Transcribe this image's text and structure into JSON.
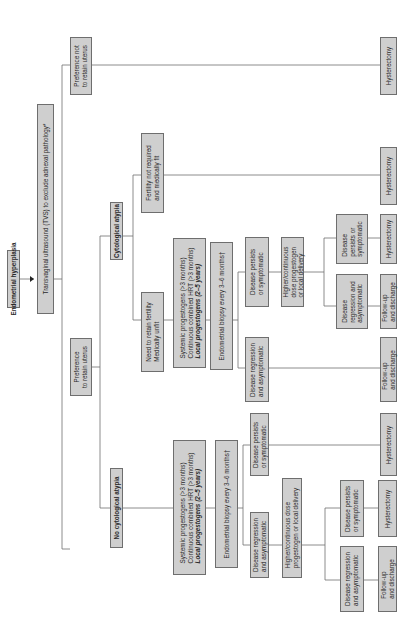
{
  "title": "Endometrial hyperplasia",
  "nodes": {
    "root": "Endometrial hyperplasia",
    "tvs": "Transvaginal ultrasound (TVS) to exclude adnexal pathology*",
    "retain": [
      "Preference",
      "to retain uterus"
    ],
    "not_retain": [
      "Preference not",
      "to retain uterus"
    ],
    "not_retain_outcome": "Hysterectomy",
    "atypia": "Cytological atypia",
    "no_atypia": "No cytological atypia",
    "atypia_fertility_not_required": [
      "Fertility not required",
      "and medically fit"
    ],
    "atypia_fertility_not_required_outcome": "Hysterectomy",
    "atypia_need_fertility": [
      "Need to retain fertility",
      "Medically unfit"
    ],
    "atypia_treatment": [
      "Systemic progestogens (>3 months)",
      "Continuous combined HRT (>3 months)",
      "Local progestogens (2–5 years)"
    ],
    "atypia_biopsy": "Endometrial biopsy every 3–6 months†",
    "atypia_persists": [
      "Disease persists",
      "or symptomatic"
    ],
    "atypia_regression": [
      "Disease regression",
      "and asymptomatic"
    ],
    "atypia_regression_outcome": [
      "Follow-up",
      "and discharge"
    ],
    "atypia_higher_dose": [
      "Higher/continuous",
      "dose progestogen",
      "or local delivery"
    ],
    "atypia_hd_persists": [
      "Disease",
      "persists or",
      "symptomatic"
    ],
    "atypia_hd_persists_outcome": "Hysterectomy",
    "atypia_hd_regression": [
      "Disease",
      "regression and",
      "asymptomatic"
    ],
    "atypia_hd_regression_outcome": [
      "Follow-up",
      "and discharge"
    ],
    "no_atypia_treatment": [
      "Systemic progestogens (>3 months)",
      "Continuous combined HRT (>3 months)",
      "Local progestogens (2–5 years)"
    ],
    "no_atypia_biopsy": "Endometrial biopsy every 3–6 months†",
    "no_atypia_persists": [
      "Disease persists",
      "or symptomatic"
    ],
    "no_atypia_persists_outcome": "Hysterectomy",
    "no_atypia_regression": [
      "Disease regression",
      "and asymptomatic"
    ],
    "no_atypia_higher_dose": [
      "Higher/continuous dose",
      "progestogen or local delivery"
    ],
    "no_atypia_hd_persists": [
      "Disease persists",
      "or symptomatic"
    ],
    "no_atypia_hd_persists_outcome": "Hysterectomy",
    "no_atypia_hd_regression": [
      "Disease regression",
      "and asymptomatic"
    ],
    "no_atypia_hd_regression_outcome": [
      "Follow-up",
      "and discharge"
    ]
  },
  "colors": {
    "box_fill": "#cfcfcf",
    "box_border": "#6e6e6e",
    "line": "#6e6e6e",
    "text": "#2a2a2a"
  }
}
